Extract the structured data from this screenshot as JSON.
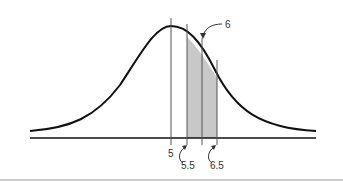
{
  "diagram": {
    "type": "normal-curve-continuity-correction",
    "labels": {
      "mean": "5",
      "lower": "5.5",
      "center": "6",
      "upper": "6.5"
    },
    "colors": {
      "curve": "#111111",
      "shade": "#c8c8c8",
      "lines": "#555555"
    }
  }
}
